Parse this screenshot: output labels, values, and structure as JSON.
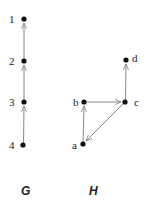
{
  "graphs": [
    {
      "name": "G",
      "nodes": [
        {
          "id": "1",
          "x": 24,
          "y": 19
        },
        {
          "id": "2",
          "x": 24,
          "y": 61
        },
        {
          "id": "3",
          "x": 24,
          "y": 102
        },
        {
          "id": "4",
          "x": 23,
          "y": 145
        }
      ],
      "edges": [
        {
          "from": "4",
          "to": "3"
        },
        {
          "from": "3",
          "to": "2"
        },
        {
          "from": "2",
          "to": "1"
        }
      ]
    },
    {
      "name": "H",
      "nodes": [
        {
          "id": "a",
          "x": 83,
          "y": 144
        },
        {
          "id": "b",
          "x": 84,
          "y": 102
        },
        {
          "id": "c",
          "x": 125,
          "y": 102
        },
        {
          "id": "d",
          "x": 126,
          "y": 60
        }
      ],
      "edges": [
        {
          "from": "a",
          "to": "b"
        },
        {
          "from": "b",
          "to": "c"
        },
        {
          "from": "c",
          "to": "d"
        },
        {
          "from": "c",
          "to": "a"
        }
      ]
    }
  ],
  "labels": {
    "g_caption": "G",
    "h_caption": "H",
    "n1": "1",
    "n2": "2",
    "n3": "3",
    "n4": "4",
    "na": "a",
    "nb": "b",
    "nc": "c",
    "nd": "d"
  },
  "colors": {
    "edge": "#888888",
    "node": "#111111"
  }
}
